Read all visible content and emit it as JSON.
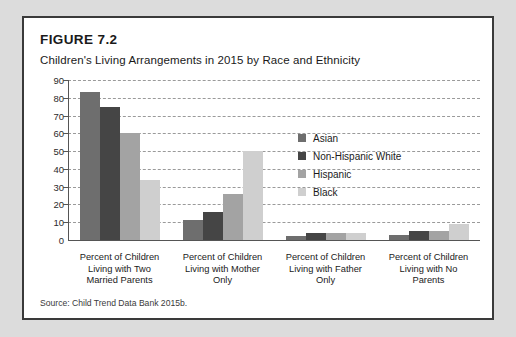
{
  "figure": {
    "number": "FIGURE 7.2",
    "title": "Children's Living Arrangements in 2015 by Race and Ethnicity",
    "source": "Source: Child Trend Data Bank 2015b."
  },
  "colors": {
    "asian": "#6e6e6e",
    "non_hispanic_white": "#454545",
    "hispanic": "#a3a3a3",
    "black": "#cfcfcf",
    "card_border": "#3a3a3a",
    "page_background": "#dcdcdc",
    "gridline": "#9a9a9a",
    "axis": "#555555",
    "text": "#1a1a1a"
  },
  "chart_data": {
    "type": "bar",
    "title": "Children's Living Arrangements in 2015 by Race and Ethnicity",
    "xlabel": "",
    "ylabel": "",
    "ylim": [
      0,
      90
    ],
    "yticks": [
      0,
      10,
      20,
      30,
      40,
      50,
      60,
      70,
      80,
      90
    ],
    "ytick_labels": [
      "0",
      "10",
      "20",
      "30",
      "40",
      "50",
      "60",
      "70",
      "80",
      "90"
    ],
    "grid": true,
    "grid_style": "dashed horizontal",
    "legend_position": "inside upper center-right",
    "categories": [
      "Percent of Children Living with Two Married Parents",
      "Percent of Children Living with Mother Only",
      "Percent of Children Living with Father Only",
      "Percent of Children Living with No Parents"
    ],
    "category_lines": [
      [
        "Percent of Children",
        "Living with Two",
        "Married Parents"
      ],
      [
        "Percent of Children",
        "Living with Mother",
        "Only"
      ],
      [
        "Percent of Children",
        "Living with Father",
        "Only"
      ],
      [
        "Percent of Children",
        "Living with No",
        "Parents"
      ]
    ],
    "series": [
      {
        "name": "Asian",
        "color": "#6e6e6e",
        "values": [
          83,
          11.5,
          2,
          3
        ]
      },
      {
        "name": "Non-Hispanic White",
        "color": "#454545",
        "values": [
          75,
          16,
          4,
          5
        ]
      },
      {
        "name": "Hispanic",
        "color": "#a3a3a3",
        "values": [
          60,
          26,
          4,
          5
        ]
      },
      {
        "name": "Black",
        "color": "#cfcfcf",
        "values": [
          34,
          50,
          4,
          9
        ]
      }
    ]
  }
}
